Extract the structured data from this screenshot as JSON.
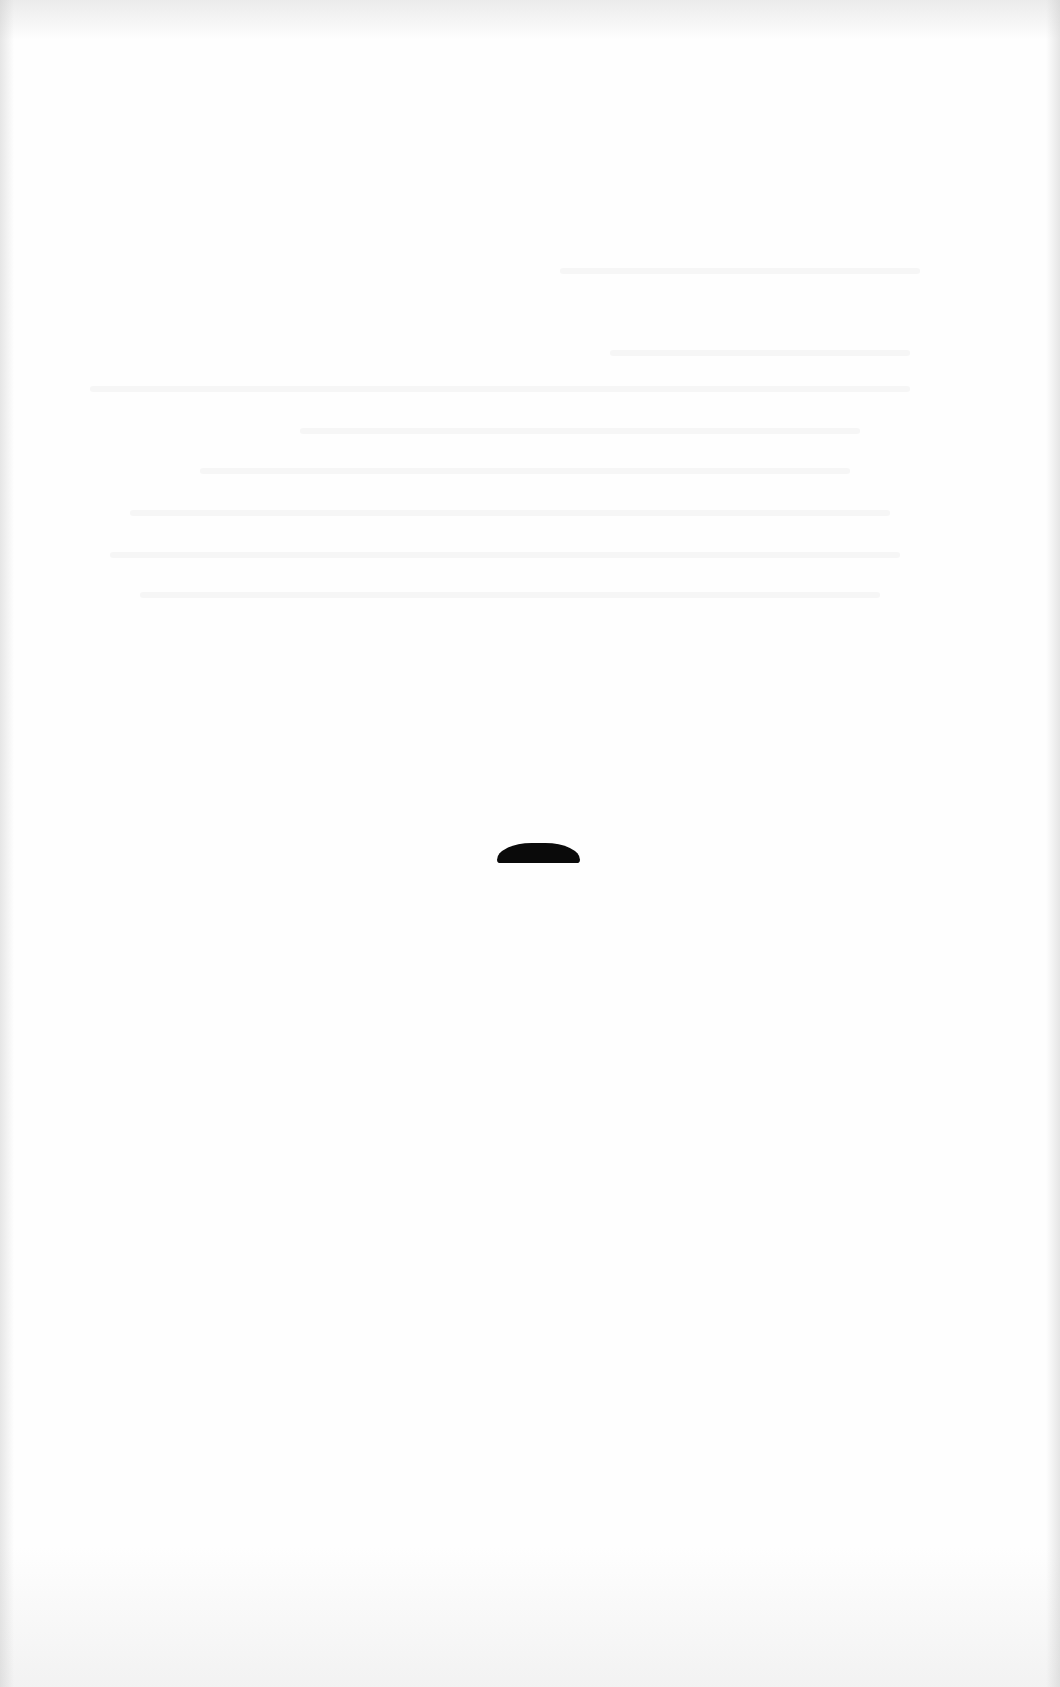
{
  "page": {
    "background_color": "#fefefe"
  },
  "ink_mark": {
    "shape": "dome",
    "color": "#0a0a0a"
  },
  "ghost_text_lines": [
    {
      "top": 268,
      "left": 560,
      "width": 360
    },
    {
      "top": 350,
      "left": 610,
      "width": 300
    },
    {
      "top": 386,
      "left": 90,
      "width": 820
    },
    {
      "top": 428,
      "left": 300,
      "width": 560
    },
    {
      "top": 468,
      "left": 200,
      "width": 650
    },
    {
      "top": 510,
      "left": 130,
      "width": 760
    },
    {
      "top": 552,
      "left": 110,
      "width": 790
    },
    {
      "top": 592,
      "left": 140,
      "width": 740
    }
  ]
}
